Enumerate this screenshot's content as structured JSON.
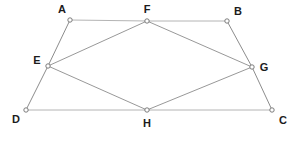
{
  "diagram": {
    "type": "geometry-figure",
    "canvas": {
      "width": 299,
      "height": 141,
      "background": "#ffffff"
    },
    "style": {
      "outer_edge_color": "#b4b4b4",
      "inner_edge_color": "#8c8c8c",
      "vertex_stroke_color": "#6e6e6e",
      "vertex_fill_color": "#ffffff",
      "label_color": "#1c1c1c",
      "outer_edge_width": 1,
      "inner_edge_width": 0.9,
      "vertex_radius": 2.2
    },
    "points": [
      {
        "id": "A",
        "label": "A",
        "x": 70,
        "y": 20,
        "label_x": 62,
        "label_y": 10,
        "label_anchor": "middle"
      },
      {
        "id": "F",
        "label": "F",
        "x": 147,
        "y": 21,
        "label_x": 147,
        "label_y": 10,
        "label_anchor": "middle"
      },
      {
        "id": "B",
        "label": "B",
        "x": 227,
        "y": 21,
        "label_x": 238,
        "label_y": 12,
        "label_anchor": "middle"
      },
      {
        "id": "E",
        "label": "E",
        "x": 48,
        "y": 66,
        "label_x": 37,
        "label_y": 61,
        "label_anchor": "middle"
      },
      {
        "id": "G",
        "label": "G",
        "x": 252,
        "y": 67,
        "label_x": 264,
        "label_y": 68,
        "label_anchor": "middle"
      },
      {
        "id": "D",
        "label": "D",
        "x": 26,
        "y": 110,
        "label_x": 16,
        "label_y": 120,
        "label_anchor": "middle"
      },
      {
        "id": "H",
        "label": "H",
        "x": 147,
        "y": 110,
        "label_x": 147,
        "label_y": 124,
        "label_anchor": "middle"
      },
      {
        "id": "C",
        "label": "C",
        "x": 272,
        "y": 110,
        "label_x": 283,
        "label_y": 121,
        "label_anchor": "middle"
      }
    ],
    "outer_edges": [
      {
        "id": "A-F",
        "from": "A",
        "to": "F",
        "x1": 70,
        "y1": 20,
        "x2": 147,
        "y2": 21
      },
      {
        "id": "F-B",
        "from": "F",
        "to": "B",
        "x1": 147,
        "y1": 21,
        "x2": 227,
        "y2": 21
      },
      {
        "id": "A-E",
        "from": "A",
        "to": "E",
        "x1": 70,
        "y1": 20,
        "x2": 48,
        "y2": 66
      },
      {
        "id": "E-D",
        "from": "E",
        "to": "D",
        "x1": 48,
        "y1": 66,
        "x2": 26,
        "y2": 110
      },
      {
        "id": "B-G",
        "from": "B",
        "to": "G",
        "x1": 227,
        "y1": 21,
        "x2": 252,
        "y2": 67
      },
      {
        "id": "G-C",
        "from": "G",
        "to": "C",
        "x1": 252,
        "y1": 67,
        "x2": 272,
        "y2": 110
      },
      {
        "id": "D-H",
        "from": "D",
        "to": "H",
        "x1": 26,
        "y1": 110,
        "x2": 147,
        "y2": 110
      },
      {
        "id": "H-C",
        "from": "H",
        "to": "C",
        "x1": 147,
        "y1": 110,
        "x2": 272,
        "y2": 110
      }
    ],
    "inner_edges": [
      {
        "id": "E-F",
        "from": "E",
        "to": "F",
        "x1": 48,
        "y1": 66,
        "x2": 147,
        "y2": 21
      },
      {
        "id": "F-G",
        "from": "F",
        "to": "G",
        "x1": 147,
        "y1": 21,
        "x2": 252,
        "y2": 67
      },
      {
        "id": "G-H",
        "from": "G",
        "to": "H",
        "x1": 252,
        "y1": 67,
        "x2": 147,
        "y2": 110
      },
      {
        "id": "H-E",
        "from": "H",
        "to": "E",
        "x1": 147,
        "y1": 110,
        "x2": 48,
        "y2": 66
      }
    ]
  }
}
